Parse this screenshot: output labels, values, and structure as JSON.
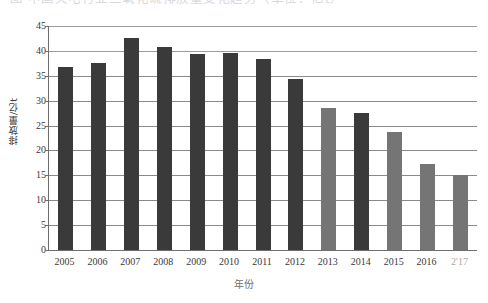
{
  "caption": {
    "text": "图 中国火电行业二氧化硫排放量变化趋势（单位：亿t）"
  },
  "axes": {
    "y_title": "排放量/亿t",
    "x_title": "年份",
    "y_ticks": [
      "0",
      "5",
      "10",
      "15",
      "20",
      "25",
      "30",
      "35",
      "40",
      "45"
    ]
  },
  "colors": {
    "bar_dark": "#3a3a3a",
    "bar_light": "#757575",
    "axis": "#6e6e6e",
    "grid": "#8a8a8a",
    "text": "#3a3a3a"
  },
  "chart_data": {
    "type": "bar",
    "title": "",
    "subtitle": "",
    "xlabel": "年份",
    "ylabel": "排放量/亿t",
    "categories": [
      "2005",
      "2006",
      "2007",
      "2008",
      "2009",
      "2010",
      "2011",
      "2012",
      "2013",
      "2014",
      "2015",
      "2016",
      "2017"
    ],
    "values": [
      36.8,
      37.6,
      42.6,
      40.8,
      39.3,
      39.6,
      38.3,
      34.4,
      28.5,
      27.6,
      23.8,
      17.3,
      15.1
    ],
    "bar_shades": [
      "dark",
      "dark",
      "dark",
      "dark",
      "dark",
      "dark",
      "dark",
      "dark",
      "light",
      "dark",
      "light",
      "light",
      "light"
    ],
    "ylim": [
      0,
      45
    ],
    "ytick_step": 5,
    "grid": true,
    "legend": "none",
    "legend_position": "none",
    "annotations": []
  },
  "x_tick_display": [
    "2005",
    "2006",
    "2007",
    "2008",
    "2009",
    "2010",
    "2011",
    "2012",
    "2013",
    "2014",
    "2015",
    "2016",
    "2'17"
  ]
}
